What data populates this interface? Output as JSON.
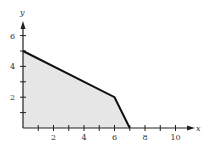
{
  "chart_data": {
    "type": "area",
    "title": "",
    "xlabel": "x",
    "ylabel": "y",
    "xlim": [
      0,
      11
    ],
    "ylim": [
      0,
      7
    ],
    "x_ticks": [
      1,
      2,
      3,
      4,
      5,
      6,
      7,
      8,
      9,
      10
    ],
    "x_tick_labels": [
      "2",
      "4",
      "6",
      "8",
      "10"
    ],
    "x_tick_label_values": [
      2,
      4,
      6,
      8,
      10
    ],
    "y_ticks": [
      1,
      2,
      3,
      4,
      5,
      6
    ],
    "y_tick_labels": [
      "2",
      "4",
      "6"
    ],
    "y_tick_label_values": [
      2,
      4,
      6
    ],
    "grid": false,
    "legend": null,
    "series": [
      {
        "name": "boundary",
        "points": [
          [
            0,
            5
          ],
          [
            6,
            2
          ],
          [
            7,
            0
          ]
        ]
      }
    ],
    "region": {
      "description": "shaded feasible region bounded by axes and boundary",
      "vertices": [
        [
          0,
          0
        ],
        [
          0,
          5
        ],
        [
          6,
          2
        ],
        [
          7,
          0
        ]
      ],
      "fill": "#e6e6e6"
    },
    "colors": {
      "axis": "#222222",
      "boundary": "#111111",
      "fill": "#e6e6e6"
    }
  }
}
